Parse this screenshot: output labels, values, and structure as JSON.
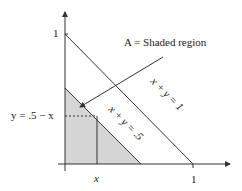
{
  "diagram": {
    "title": "",
    "colors": {
      "shade": "#d6d6d6",
      "line": "#333333",
      "axis": "#333333"
    },
    "axes": {
      "x_tick_labels": [
        "x",
        "1"
      ],
      "y_tick_labels": [
        "1"
      ],
      "x_tick_x_label": "x",
      "x_tick_1_label": "1",
      "y_tick_1_label": "1"
    },
    "labels": {
      "region": "A = Shaded region",
      "line_outer": "x + y = 1",
      "line_inner": "x + y = .5",
      "height": "y = .5 − x"
    }
  }
}
